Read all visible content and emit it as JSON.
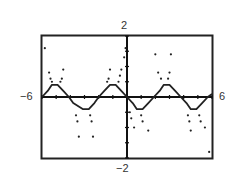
{
  "window": {
    "xmin": -6,
    "xmax": 6,
    "ymin": -2,
    "ymax": 2,
    "xscl": 1,
    "yscl": 0.5
  },
  "labels": {
    "xmin": "−6",
    "xmax": "6",
    "ymin": "−2",
    "ymax": "2"
  },
  "colors": {
    "frame": "#222222",
    "axis": "#111111",
    "curve": "#222222",
    "background": "#ffffff"
  },
  "chart_data": {
    "type": "line",
    "title": "",
    "xlabel": "",
    "ylabel": "",
    "xlim": [
      -6,
      6
    ],
    "ylim": [
      -2,
      2
    ],
    "grid": false,
    "legend": null,
    "tick_labels": {
      "x": [
        "-6",
        "6"
      ],
      "y": [
        "-2",
        "2"
      ]
    },
    "series": [
      {
        "name": "trace",
        "style": "line",
        "x": [
          -6.0,
          -5.6,
          -5.3,
          -4.9,
          -4.5,
          -4.1,
          -3.8,
          -3.1,
          -2.7,
          -2.3,
          -2.0,
          -1.6,
          -1.2,
          -0.8,
          -0.4,
          0.0,
          0.4,
          0.7,
          1.1,
          1.5,
          1.9,
          2.3,
          2.6,
          3.0,
          3.4,
          3.8,
          4.2,
          4.5,
          4.9,
          5.3,
          5.7,
          6.0
        ],
        "y": [
          0.0,
          0.2,
          0.4,
          0.4,
          0.2,
          0.0,
          -0.2,
          -0.4,
          -0.4,
          -0.2,
          0.0,
          0.2,
          0.4,
          0.4,
          0.2,
          0.0,
          -0.2,
          -0.4,
          -0.4,
          -0.2,
          0.0,
          0.2,
          0.4,
          0.4,
          0.2,
          0.0,
          -0.2,
          -0.4,
          -0.4,
          -0.2,
          0.0,
          0.1
        ]
      },
      {
        "name": "scatter-branches",
        "style": "points",
        "points": [
          [
            -5.8,
            1.6
          ],
          [
            -5.5,
            0.8
          ],
          [
            -5.4,
            0.6
          ],
          [
            -5.3,
            0.5
          ],
          [
            -4.7,
            0.5
          ],
          [
            -4.6,
            0.6
          ],
          [
            -4.5,
            0.9
          ],
          [
            -3.6,
            -0.6
          ],
          [
            -3.5,
            -0.8
          ],
          [
            -3.4,
            -1.3
          ],
          [
            -2.6,
            -0.6
          ],
          [
            -2.5,
            -0.8
          ],
          [
            -2.4,
            -1.3
          ],
          [
            -1.4,
            0.5
          ],
          [
            -1.3,
            0.6
          ],
          [
            -1.2,
            0.9
          ],
          [
            -0.6,
            0.5
          ],
          [
            -0.5,
            0.7
          ],
          [
            -0.4,
            0.9
          ],
          [
            -0.2,
            1.3
          ],
          [
            -0.1,
            1.6
          ],
          [
            0.2,
            -0.5
          ],
          [
            0.3,
            -0.7
          ],
          [
            0.5,
            -1.0
          ],
          [
            1.0,
            -0.6
          ],
          [
            1.1,
            -0.8
          ],
          [
            1.5,
            -1.1
          ],
          [
            2.0,
            1.4
          ],
          [
            2.2,
            0.8
          ],
          [
            2.4,
            0.6
          ],
          [
            2.9,
            0.6
          ],
          [
            3.0,
            0.8
          ],
          [
            3.1,
            1.4
          ],
          [
            4.3,
            -0.6
          ],
          [
            4.4,
            -0.8
          ],
          [
            4.5,
            -1.1
          ],
          [
            5.1,
            -0.6
          ],
          [
            5.2,
            -0.8
          ],
          [
            5.5,
            -1.0
          ],
          [
            5.8,
            -1.8
          ]
        ]
      }
    ]
  }
}
